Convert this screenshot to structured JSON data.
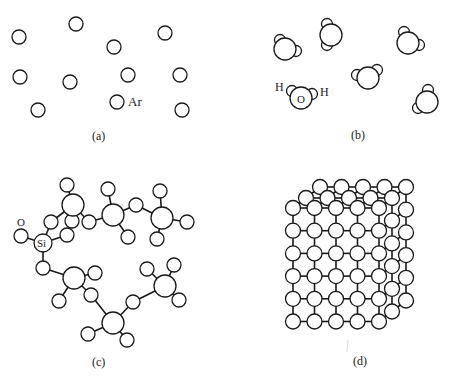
{
  "figure": {
    "panels": [
      {
        "id": "a",
        "caption": "(a)",
        "description": "Gas: isolated argon atoms",
        "atom_label": "Ar",
        "atoms": [
          [
            19,
            37
          ],
          [
            76,
            24
          ],
          [
            114,
            47
          ],
          [
            165,
            33
          ],
          [
            20,
            77
          ],
          [
            70,
            82
          ],
          [
            128,
            75
          ],
          [
            180,
            75
          ],
          [
            38,
            110
          ],
          [
            117,
            102
          ],
          [
            182,
            110
          ]
        ],
        "atom_radius": 7
      },
      {
        "id": "b",
        "caption": "(b)",
        "description": "Liquid/gas: water molecules",
        "labels": {
          "h_left": "H",
          "oxygen": "O",
          "h_right": "H"
        },
        "molecules": [
          {
            "o": [
              285,
              49
            ],
            "h": [
              [
                280,
                40
              ],
              [
                296,
                51
              ]
            ]
          },
          {
            "o": [
              331,
              35
            ],
            "h": [
              [
                327,
                24
              ],
              [
                327,
                45
              ]
            ]
          },
          {
            "o": [
              408,
              43
            ],
            "h": [
              [
                404,
                32
              ],
              [
                419,
                45
              ]
            ]
          },
          {
            "o": [
              368,
              78
            ],
            "h": [
              [
                357,
                75
              ],
              [
                377,
                70
              ]
            ]
          },
          {
            "o": [
              301,
              98
            ],
            "h": [
              [
                292,
                91
              ],
              [
                312,
                94
              ]
            ]
          },
          {
            "o": [
              427,
              102
            ],
            "h": [
              [
                428,
                90
              ],
              [
                418,
                108
              ]
            ]
          }
        ],
        "o_radius": 11,
        "h_radius": 5.5
      },
      {
        "id": "c",
        "caption": "(c)",
        "description": "Amorphous solid: silicon-oxygen network",
        "labels": {
          "oxygen": "O",
          "silicon": "Si"
        }
      },
      {
        "id": "d",
        "caption": "(d)",
        "description": "Crystalline solid: cubic lattice",
        "front_grid": {
          "cols": 5,
          "rows": 6,
          "x0": 293,
          "y0": 208,
          "dx": 21.5,
          "dy": 22.7,
          "r": 7.5
        }
      }
    ]
  }
}
